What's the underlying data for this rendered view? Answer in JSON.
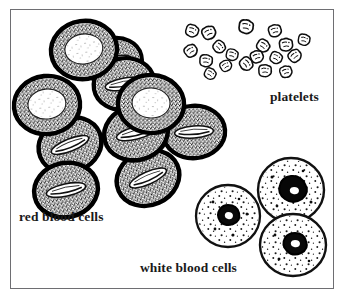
{
  "figure": {
    "title": "Blood cells",
    "background_color": "#ffffff",
    "frame_color": "#6e6e72",
    "ink_color": "#000000"
  },
  "labels": {
    "red_blood_cells": "red blood cells",
    "platelets": "platelets",
    "white_blood_cells": "white blood cells"
  },
  "cells": {
    "red_blood_cells": {
      "label": "red blood cells",
      "count": 10,
      "description": "thick stippled ring with pale biconcave center",
      "items": [
        {
          "cx": 84,
          "cy": 50,
          "rx": 33,
          "ry": 29,
          "rot": -8,
          "view": "face",
          "inner_rx": 19,
          "inner_ry": 15
        },
        {
          "cx": 47,
          "cy": 105,
          "rx": 33,
          "ry": 29,
          "rot": -6,
          "view": "face",
          "inner_rx": 19,
          "inner_ry": 14
        },
        {
          "cx": 151,
          "cy": 104,
          "rx": 33,
          "ry": 29,
          "rot": 2,
          "view": "face",
          "inner_rx": 19,
          "inner_ry": 14
        },
        {
          "cx": 124,
          "cy": 84,
          "rx": 30,
          "ry": 26,
          "rot": -10,
          "view": "slit",
          "inner_rx": 19,
          "inner_ry": 6
        },
        {
          "cx": 136,
          "cy": 133,
          "rx": 32,
          "ry": 28,
          "rot": -14,
          "view": "slit",
          "inner_rx": 20,
          "inner_ry": 6
        },
        {
          "cx": 194,
          "cy": 132,
          "rx": 31,
          "ry": 26,
          "rot": -4,
          "view": "slit",
          "inner_rx": 21,
          "inner_ry": 7
        },
        {
          "cx": 70,
          "cy": 145,
          "rx": 32,
          "ry": 27,
          "rot": -22,
          "view": "slit",
          "inner_rx": 19,
          "inner_ry": 6
        },
        {
          "cx": 66,
          "cy": 190,
          "rx": 32,
          "ry": 26,
          "rot": -12,
          "view": "slit",
          "inner_rx": 19,
          "inner_ry": 6
        },
        {
          "cx": 148,
          "cy": 178,
          "rx": 31,
          "ry": 27,
          "rot": -24,
          "view": "slit",
          "inner_rx": 19,
          "inner_ry": 6
        },
        {
          "cx": 114,
          "cy": 62,
          "rx": 28,
          "ry": 24,
          "rot": -14,
          "view": "slit",
          "inner_rx": 17,
          "inner_ry": 5
        }
      ]
    },
    "platelets": {
      "label": "platelets",
      "count": 19,
      "description": "small irregular pale fragments with dark speckled outlines",
      "items": [
        {
          "cx": 192,
          "cy": 31,
          "r": 6.0,
          "rot": 20
        },
        {
          "cx": 209,
          "cy": 33,
          "r": 6.4,
          "rot": -25
        },
        {
          "cx": 246,
          "cy": 27,
          "r": 6.8,
          "rot": 10
        },
        {
          "cx": 275,
          "cy": 31,
          "r": 6.2,
          "rot": -15
        },
        {
          "cx": 263,
          "cy": 46,
          "r": 6.0,
          "rot": 35
        },
        {
          "cx": 286,
          "cy": 45,
          "r": 6.3,
          "rot": -5
        },
        {
          "cx": 219,
          "cy": 47,
          "r": 5.8,
          "rot": 45
        },
        {
          "cx": 191,
          "cy": 51,
          "r": 6.1,
          "rot": -35
        },
        {
          "cx": 232,
          "cy": 55,
          "r": 5.6,
          "rot": 15
        },
        {
          "cx": 257,
          "cy": 57,
          "r": 6.0,
          "rot": -20
        },
        {
          "cx": 276,
          "cy": 58,
          "r": 5.7,
          "rot": 25
        },
        {
          "cx": 295,
          "cy": 56,
          "r": 6.0,
          "rot": -40
        },
        {
          "cx": 206,
          "cy": 61,
          "r": 5.9,
          "rot": 5
        },
        {
          "cx": 226,
          "cy": 66,
          "r": 5.5,
          "rot": -30
        },
        {
          "cx": 246,
          "cy": 64,
          "r": 6.2,
          "rot": 50
        },
        {
          "cx": 265,
          "cy": 71,
          "r": 5.8,
          "rot": 0
        },
        {
          "cx": 286,
          "cy": 72,
          "r": 5.6,
          "rot": -18
        },
        {
          "cx": 210,
          "cy": 74,
          "r": 5.4,
          "rot": 30
        },
        {
          "cx": 304,
          "cy": 40,
          "r": 5.5,
          "rot": 12
        }
      ]
    },
    "white_blood_cells": {
      "label": "white blood cells",
      "count": 3,
      "description": "large pale speckled cells with dark irregular nucleus",
      "items": [
        {
          "cx": 228,
          "cy": 216,
          "rx": 32,
          "ry": 31,
          "nucleus_cx": 228,
          "nucleus_cy": 218,
          "nucleus_r": 11
        },
        {
          "cx": 291,
          "cy": 190,
          "rx": 33,
          "ry": 32,
          "nucleus_cx": 295,
          "nucleus_cy": 191,
          "nucleus_r": 14
        },
        {
          "cx": 293,
          "cy": 245,
          "rx": 33,
          "ry": 31,
          "nucleus_cx": 297,
          "nucleus_cy": 243,
          "nucleus_r": 12
        }
      ]
    }
  }
}
